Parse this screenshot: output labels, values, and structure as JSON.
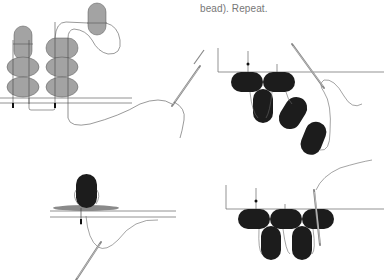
{
  "caption": {
    "text": "bead). Repeat."
  },
  "colors": {
    "bead_gray": "#a3a3a3",
    "bead_black": "#1c1c1c",
    "thread": "#666666",
    "needle": "#888888",
    "caption_text": "#777777"
  },
  "figures": [
    {
      "id": "figure-1",
      "description": "Gray beads stacked in two columns with an extra bead on thread and needle at right"
    },
    {
      "id": "figure-2",
      "description": "Black beads in a row with beads hanging diagonally and a needle at top right"
    },
    {
      "id": "figure-3",
      "description": "Single black bead on a flat gray disc above two rails with a needle pointing down-left"
    },
    {
      "id": "figure-4",
      "description": "Row of three black beads with two hanging beads and a vertical needle passing through"
    }
  ]
}
